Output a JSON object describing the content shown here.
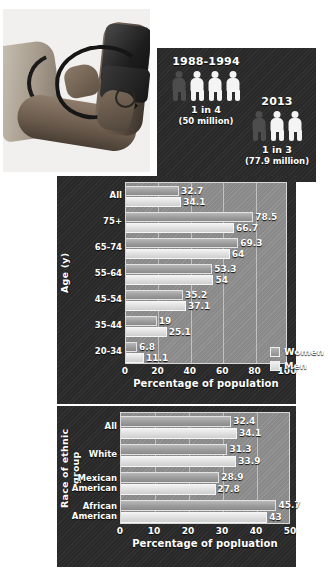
{
  "photo": {
    "alt": "blood-pressure-measurement-photo"
  },
  "stats": {
    "groups": [
      {
        "year": "1988-1994",
        "ratio": "1 in 4",
        "sub": "(50 million)",
        "total_figures": 4,
        "affected_figures": 1
      },
      {
        "year": "2013",
        "ratio": "1 in 3",
        "sub": "(77.9 million)",
        "total_figures": 3,
        "affected_figures": 1
      }
    ]
  },
  "chart_data": [
    {
      "type": "bar",
      "orientation": "horizontal",
      "id": "age-chart",
      "title": "",
      "ylabel": "Age (y)",
      "xlabel": "Percentage of population",
      "xlim": [
        0,
        100
      ],
      "xticks": [
        "0",
        "20",
        "40",
        "60",
        "80",
        "100"
      ],
      "grid": true,
      "legend_position": "bottom-right",
      "categories": [
        "All",
        "75+",
        "65-74",
        "55-64",
        "45-54",
        "35-44",
        "20-34"
      ],
      "series": [
        {
          "name": "Women",
          "values": [
            32.7,
            78.5,
            69.3,
            53.3,
            35.2,
            19,
            6.8
          ],
          "labels": [
            "32.7",
            "78.5",
            "69.3",
            "53.3",
            "35.2",
            "19",
            "6.8"
          ]
        },
        {
          "name": "Men",
          "values": [
            34.1,
            66.7,
            64,
            54,
            37.1,
            25.1,
            11.1
          ],
          "labels": [
            "34.1",
            "66.7",
            "64",
            "54",
            "37.1",
            "25.1",
            "11.1"
          ]
        }
      ]
    },
    {
      "type": "bar",
      "orientation": "horizontal",
      "id": "race-chart",
      "title": "",
      "ylabel": "Race of ethnic group",
      "xlabel": "Percentage of popluation",
      "xlim": [
        0,
        50
      ],
      "xticks": [
        "0",
        "10",
        "20",
        "30",
        "40",
        "50"
      ],
      "grid": true,
      "legend_position": "none",
      "categories": [
        "All",
        "White",
        "Mexican\nAmerican",
        "African\nAmerican"
      ],
      "series": [
        {
          "name": "Women",
          "values": [
            32.4,
            31.3,
            28.9,
            45.7
          ],
          "labels": [
            "32.4",
            "31.3",
            "28.9",
            "45.7"
          ]
        },
        {
          "name": "Men",
          "values": [
            34.1,
            33.9,
            27.8,
            43
          ],
          "labels": [
            "34.1",
            "33.9",
            "27.8",
            "43"
          ]
        }
      ]
    }
  ],
  "colors": {
    "panel_background": "#2b2b2b",
    "plot_background": "#8f8f8f",
    "women_bar": "#9e9e9e",
    "men_bar": "#dedede",
    "text": "#ffffff"
  }
}
